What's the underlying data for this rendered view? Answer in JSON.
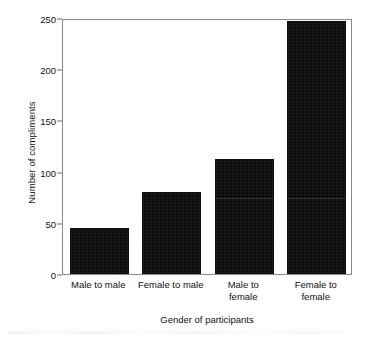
{
  "chart_data": {
    "type": "bar",
    "title": "",
    "xlabel": "Gender of participants",
    "ylabel": "Number of compliments",
    "categories": [
      "Male to male",
      "Female to male",
      "Male to\nfemale",
      "Female to\nfemale"
    ],
    "values": [
      45,
      80,
      112,
      247
    ],
    "ylim": [
      0,
      250
    ],
    "yticks": [
      0,
      50,
      100,
      150,
      200,
      250
    ],
    "ytick_labels": [
      "0",
      "50",
      "100",
      "150",
      "200",
      "250"
    ],
    "grid": false,
    "legend": null,
    "bar_color": "#0d0d0d",
    "frame_color": "#8a8a8a",
    "background": "#ffffff"
  },
  "figure": {
    "y_axis_title": "Number of compliments",
    "x_axis_title": "Gender of participants"
  }
}
